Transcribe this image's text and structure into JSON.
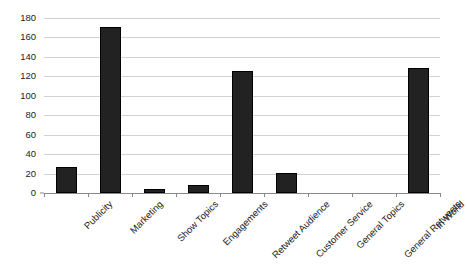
{
  "chart_data": {
    "type": "bar",
    "title": "",
    "subtitle": "",
    "xlabel": "",
    "ylabel": "",
    "categories": [
      "Publicity",
      "Marketing",
      "Show Topics",
      "Engagements",
      "Retweet Audience",
      "Customer Service",
      "General Topics",
      "General Retweets",
      "In World"
    ],
    "values": [
      27,
      171,
      4,
      8,
      125,
      21,
      0,
      0,
      129
    ],
    "ylim": [
      0,
      180
    ],
    "yticks": [
      0,
      20,
      40,
      60,
      80,
      100,
      120,
      140,
      160,
      180
    ],
    "ytick_labels": [
      "0",
      "20",
      "40",
      "60",
      "80",
      "100",
      "120",
      "140",
      "160",
      "180"
    ],
    "grid": true,
    "grid_axis": "y",
    "legend": false,
    "legend_position": "none",
    "bar_color": "#222222",
    "bar_edge_color": "#000000",
    "grid_color": "#d2d2d2",
    "axis_color": "#8a8a8a",
    "text_color": "#1c1c1c",
    "background_color": "#ffffff",
    "xtick_label_rotation": -45
  }
}
